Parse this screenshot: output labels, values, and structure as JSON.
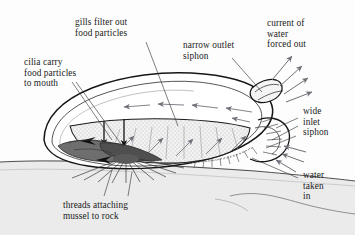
{
  "figure": {
    "background_color": "#fdfdfd",
    "ink_color": "#1a1a1a",
    "arrow_color": "#6f6f78",
    "rock_color": "#e8e8e8",
    "gill_color": "#efefef",
    "foot_color": "#6a6a6a",
    "mantle_color": "#555555"
  },
  "labels": {
    "gills": "gills filter out\nfood particles",
    "cilia": "cilia carry\nfood particles\nto mouth",
    "outlet_siphon": "narrow outlet\nsiphon",
    "current_out": "current of\nwater\nforced out",
    "inlet_siphon": "wide\ninlet\nsiphon",
    "water_in": "water\ntaken\nin",
    "threads": "threads attaching\nmussel to rock"
  }
}
